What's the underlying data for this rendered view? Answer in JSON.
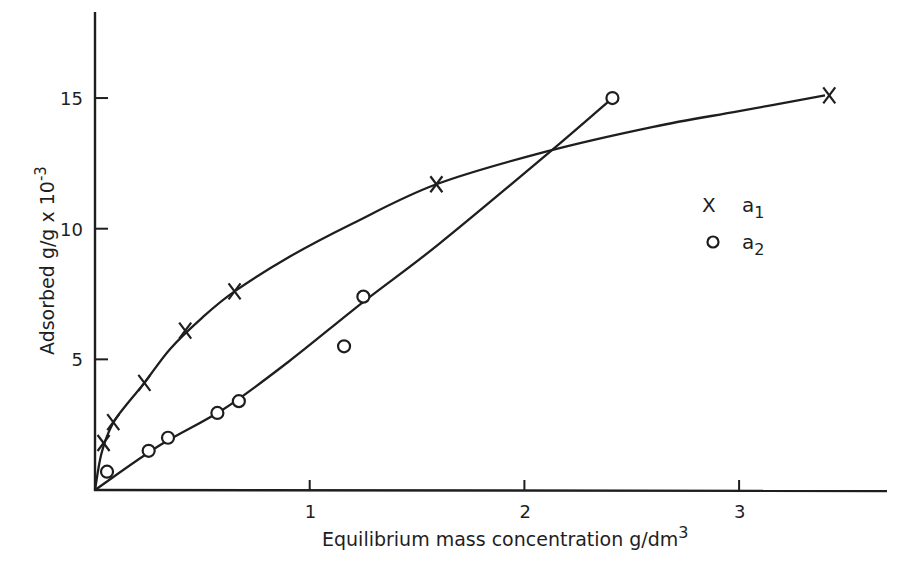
{
  "chart_data": {
    "type": "scatter",
    "title": "",
    "xlabel": "Equilibrium mass concentration g/dm",
    "xlabel_superscript": "3",
    "ylabel": "Adsorbed g/g x 10",
    "ylabel_superscript": "-3",
    "xlim": [
      0,
      3.7
    ],
    "ylim": [
      0,
      18
    ],
    "x_ticks": [
      1,
      2,
      3
    ],
    "x_tick_labels": [
      "1",
      "2",
      "3"
    ],
    "y_ticks": [
      5,
      10,
      15
    ],
    "y_tick_labels": [
      "5",
      "10",
      "15"
    ],
    "grid": false,
    "legend_position": "right-center",
    "series": [
      {
        "name": "a1",
        "marker": "x",
        "points": [
          {
            "x": 0.04,
            "y": 1.8
          },
          {
            "x": 0.085,
            "y": 2.6
          },
          {
            "x": 0.23,
            "y": 4.1
          },
          {
            "x": 0.42,
            "y": 6.1
          },
          {
            "x": 0.65,
            "y": 7.6
          },
          {
            "x": 1.59,
            "y": 11.7
          },
          {
            "x": 3.42,
            "y": 15.1
          }
        ],
        "curve": [
          [
            0,
            0
          ],
          [
            0.03,
            1.4
          ],
          [
            0.08,
            2.5
          ],
          [
            0.15,
            3.3
          ],
          [
            0.23,
            4.1
          ],
          [
            0.35,
            5.4
          ],
          [
            0.5,
            6.6
          ],
          [
            0.65,
            7.6
          ],
          [
            0.9,
            8.9
          ],
          [
            1.2,
            10.2
          ],
          [
            1.59,
            11.7
          ],
          [
            2.1,
            12.95
          ],
          [
            2.6,
            13.9
          ],
          [
            3.0,
            14.5
          ],
          [
            3.4,
            15.1
          ]
        ]
      },
      {
        "name": "a2",
        "marker": "o",
        "points": [
          {
            "x": 0.056,
            "y": 0.7
          },
          {
            "x": 0.25,
            "y": 1.5
          },
          {
            "x": 0.34,
            "y": 2.0
          },
          {
            "x": 0.57,
            "y": 2.95
          },
          {
            "x": 0.67,
            "y": 3.4
          },
          {
            "x": 1.16,
            "y": 5.5
          },
          {
            "x": 1.25,
            "y": 7.4
          },
          {
            "x": 2.41,
            "y": 15.0
          }
        ],
        "curve": [
          [
            0,
            0
          ],
          [
            0.3,
            1.7
          ],
          [
            0.6,
            3.1
          ],
          [
            0.9,
            4.9
          ],
          [
            1.25,
            7.2
          ],
          [
            1.6,
            9.4
          ],
          [
            2.12,
            12.95
          ],
          [
            2.41,
            15.0
          ]
        ]
      }
    ],
    "legend": [
      {
        "symbol": "X",
        "label": "a",
        "subscript": "1"
      },
      {
        "symbol": "o",
        "label": "a",
        "subscript": "2"
      }
    ]
  }
}
